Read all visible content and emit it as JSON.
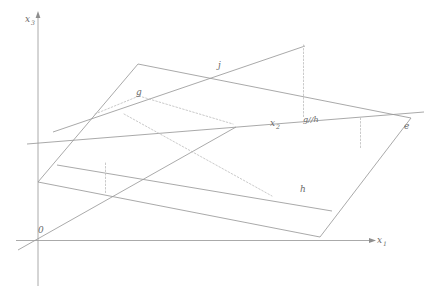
{
  "figure": {
    "background_color": "#ffffff",
    "line_color": "#8c8c8c",
    "axis_color": "#9a9a9a",
    "dashed_color": "#b9b9b9",
    "label_color": "#6a6a6a",
    "width": 433,
    "height": 296
  },
  "axes": {
    "vertical": {
      "label": "x",
      "subscript": "3",
      "name": "x3-axis"
    },
    "horizontal": {
      "label": "x",
      "subscript": "1",
      "name": "x1-axis"
    },
    "depth": {
      "label": "x",
      "subscript": "2",
      "name": "x2-axis"
    },
    "origin": {
      "label": "0",
      "name": "origin"
    }
  },
  "labels": {
    "line_j": "j",
    "line_g": "g",
    "line_h": "h",
    "parallel_note": "g//h",
    "plane_e": "e",
    "axis_x1": "x",
    "axis_x1_sub": "1",
    "axis_x2": "x",
    "axis_x2_sub": "2",
    "axis_x3": "x",
    "axis_x3_sub": "3",
    "origin": "0"
  },
  "geometry": {
    "plane": {
      "name": "plane-e",
      "vertices": [
        [
          138,
          64
        ],
        [
          411,
          118
        ],
        [
          320,
          237
        ],
        [
          38,
          182
        ]
      ]
    },
    "x3_axis": {
      "from": [
        38,
        285
      ],
      "to": [
        38,
        12
      ]
    },
    "x1_axis": {
      "from": [
        18,
        240
      ],
      "to": [
        376,
        240
      ]
    },
    "x2_axis": {
      "from": [
        18,
        248
      ],
      "to": [
        235,
        127
      ]
    },
    "line_j": {
      "from": [
        55,
        131
      ],
      "to": [
        304,
        47
      ]
    },
    "line_g_h": {
      "from": [
        28,
        143
      ],
      "to": [
        421,
        113
      ]
    },
    "line_h": {
      "from": [
        58,
        165
      ],
      "to": [
        330,
        210
      ]
    },
    "dotted_segments": [
      {
        "from": [
          96,
          113
        ],
        "to": [
          139,
          96
        ]
      },
      {
        "from": [
          139,
          96
        ],
        "to": [
          232,
          124
        ]
      },
      {
        "from": [
          124,
          115
        ],
        "to": [
          271,
          195
        ]
      },
      {
        "from": [
          303,
          45
        ],
        "to": [
          303,
          118
        ]
      },
      {
        "from": [
          360,
          119
        ],
        "to": [
          360,
          146
        ]
      },
      {
        "from": [
          105,
          163
        ],
        "to": [
          105,
          193
        ]
      }
    ]
  }
}
